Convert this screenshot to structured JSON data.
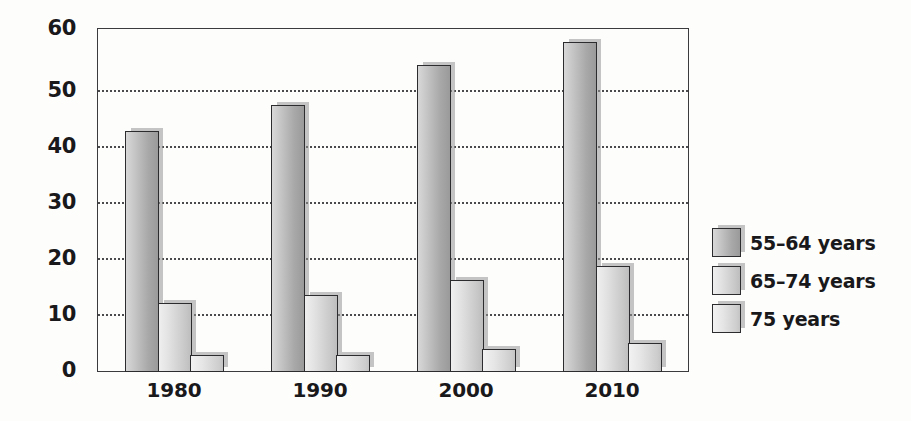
{
  "chart_data": {
    "type": "bar",
    "title": "",
    "subtitle": "",
    "xlabel": "",
    "ylabel": "",
    "categories": [
      "1980",
      "1990",
      "2000",
      "2010"
    ],
    "series": [
      {
        "name": "55–64 years",
        "values": [
          42,
          46.5,
          53.5,
          57.5
        ]
      },
      {
        "name": "65–74 years",
        "values": [
          12,
          13.5,
          16,
          18.5
        ]
      },
      {
        "name": "75 years",
        "values": [
          3,
          3,
          4,
          5
        ]
      }
    ],
    "yticks": [
      60,
      50,
      40,
      30,
      20,
      10,
      0
    ],
    "ylim": [
      0,
      60
    ],
    "grid": "horizontal-dotted",
    "legend_position": "right",
    "colors": {
      "series_55_64": "#a8a8a8",
      "series_65_74": "#c6c6c6",
      "series_75": "#cdcdcd",
      "axis": "#3b3a3c",
      "gridline": "#4a494b",
      "text": "#19181a",
      "background": "#fdfdfc"
    }
  }
}
